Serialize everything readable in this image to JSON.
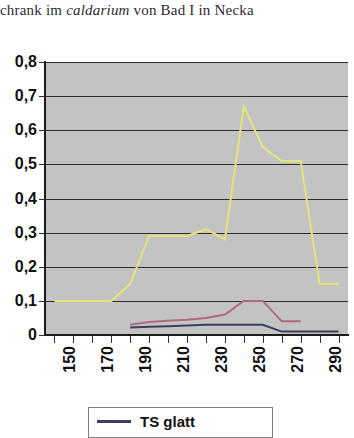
{
  "caption": {
    "before": "chrank im ",
    "italic": "caldarium",
    "after": " von Bad I in Necka"
  },
  "legend": {
    "entries": [
      {
        "label": "TS glatt",
        "color": "#3c3f63"
      }
    ]
  },
  "chart_data": {
    "type": "line",
    "title": "",
    "xlabel": "",
    "ylabel": "",
    "xlim": [
      145,
      305
    ],
    "ylim": [
      0,
      0.8
    ],
    "grid": true,
    "legend_position": "bottom",
    "plot_background": "#c3c3c3",
    "ytick_labels": [
      "0,8",
      "0,7",
      "0,6",
      "0,5",
      "0,4",
      "0,3",
      "0,2",
      "0,1",
      "0"
    ],
    "ytick_values": [
      0.8,
      0.7,
      0.6,
      0.5,
      0.4,
      0.3,
      0.2,
      0.1,
      0
    ],
    "xtick_labels": [
      "150",
      "170",
      "190",
      "210",
      "230",
      "250",
      "270",
      "290"
    ],
    "xtick_values": [
      150,
      170,
      190,
      210,
      230,
      250,
      270,
      290
    ],
    "x": [
      150,
      160,
      170,
      180,
      190,
      200,
      210,
      220,
      230,
      240,
      250,
      260,
      270,
      280,
      290,
      300
    ],
    "series": [
      {
        "name": "yellow-series",
        "color": "#e4e47c",
        "values": [
          0.1,
          0.1,
          0.1,
          0.1,
          0.15,
          0.29,
          0.29,
          0.29,
          0.31,
          0.28,
          0.67,
          0.55,
          0.51,
          0.51,
          0.15,
          0.15
        ]
      },
      {
        "name": "pink-series",
        "color": "#b4687f",
        "values": [
          null,
          null,
          null,
          null,
          0.03,
          0.038,
          0.042,
          0.045,
          0.05,
          0.06,
          0.1,
          0.1,
          0.04,
          0.04,
          null,
          null
        ]
      },
      {
        "name": "navy-series",
        "color": "#3c3f63",
        "values": [
          null,
          null,
          null,
          null,
          0.022,
          0.024,
          0.026,
          0.028,
          0.03,
          0.03,
          0.03,
          0.03,
          0.01,
          0.01,
          0.01,
          0.01
        ]
      }
    ]
  }
}
